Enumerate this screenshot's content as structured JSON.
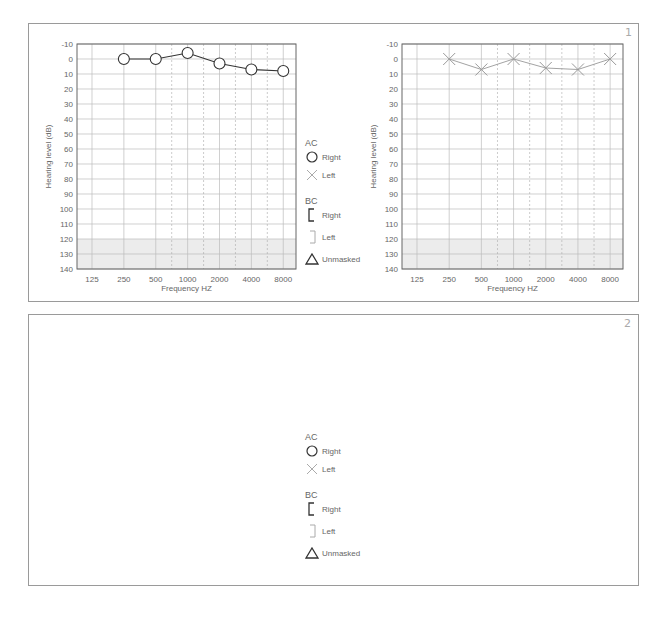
{
  "panels": [
    {
      "id": "1",
      "badge": "1"
    },
    {
      "id": "2",
      "badge": "2"
    }
  ],
  "axes": {
    "ylabel": "Hearing level (dB)",
    "xlabel": "Frequency HZ",
    "yticks": [
      "-10",
      "0",
      "10",
      "20",
      "30",
      "40",
      "50",
      "60",
      "70",
      "80",
      "90",
      "100",
      "110",
      "120",
      "130",
      "140"
    ],
    "xticks": [
      "125",
      "250",
      "500",
      "1000",
      "2000",
      "4000",
      "8000"
    ]
  },
  "legend": {
    "ac_header": "AC",
    "ac_right": "Right",
    "ac_left": "Left",
    "bc_header": "BC",
    "bc_right": "Right",
    "bc_left": "Left",
    "unmasked": "Unmasked"
  },
  "colors": {
    "right_ear": "#333333",
    "left_ear": "#999999",
    "grid": "#bbbbbb",
    "shaded_region": "#ececec"
  },
  "chart_data": [
    {
      "type": "line",
      "title": "Panel 1 - Right ear",
      "xlabel": "Frequency HZ",
      "ylabel": "Hearing level (dB)",
      "categories": [
        "125",
        "250",
        "500",
        "1000",
        "2000",
        "4000",
        "8000"
      ],
      "ylim": [
        -10,
        140
      ],
      "y_inverted": true,
      "grid": true,
      "shaded_range": [
        120,
        140
      ],
      "series": [
        {
          "name": "AC Right",
          "marker": "circle",
          "values": [
            null,
            0,
            0,
            -4,
            3,
            7,
            8
          ]
        }
      ]
    },
    {
      "type": "line",
      "title": "Panel 1 - Left ear",
      "xlabel": "Frequency HZ",
      "ylabel": "Hearing level (dB)",
      "categories": [
        "125",
        "250",
        "500",
        "1000",
        "2000",
        "4000",
        "8000"
      ],
      "ylim": [
        -10,
        140
      ],
      "y_inverted": true,
      "grid": true,
      "shaded_range": [
        120,
        140
      ],
      "series": [
        {
          "name": "AC Left",
          "marker": "x",
          "values": [
            null,
            0,
            7,
            0,
            6,
            7,
            0
          ]
        }
      ]
    },
    {
      "type": "line",
      "title": "Panel 2 - Right ear",
      "xlabel": "Frequency HZ",
      "ylabel": "Hearing level (dB)",
      "categories": [
        "125",
        "250",
        "500",
        "1000",
        "2000",
        "4000",
        "8000"
      ],
      "ylim": [
        -10,
        140
      ],
      "y_inverted": true,
      "grid": true,
      "shaded_range": [
        120,
        140
      ],
      "series": [
        {
          "name": "AC Right",
          "marker": "circle",
          "values": [
            null,
            16,
            16,
            22,
            32,
            42,
            62
          ]
        },
        {
          "name": "BC Unmasked",
          "marker": "triangle",
          "values": [
            null,
            null,
            17,
            23,
            33,
            43,
            null
          ]
        }
      ]
    },
    {
      "type": "line",
      "title": "Panel 2 - Left ear",
      "xlabel": "Frequency HZ",
      "ylabel": "Hearing level (dB)",
      "categories": [
        "125",
        "250",
        "500",
        "1000",
        "2000",
        "4000",
        "8000"
      ],
      "ylim": [
        -10,
        140
      ],
      "y_inverted": true,
      "grid": true,
      "shaded_range": [
        120,
        140
      ],
      "series": [
        {
          "name": "AC Left",
          "marker": "x",
          "values": [
            null,
            20,
            20,
            25,
            40,
            57,
            70
          ]
        }
      ]
    }
  ]
}
